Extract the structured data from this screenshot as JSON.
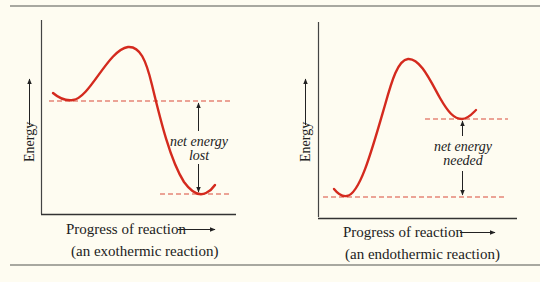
{
  "colors": {
    "curve": "#d42a1e",
    "dashed": "#d94a3a",
    "axis": "#333333",
    "rule": "#a8a8a0",
    "background": "#fefcf1"
  },
  "panels": [
    {
      "id": "exothermic",
      "y_axis_label": "Energy",
      "x_axis_label": "Progress of reaction",
      "caption": "(an exothermic reaction)",
      "annotation_line1": "net energy",
      "annotation_line2": "lost",
      "annotation_arrows": "double (up toward reactant level, down toward product level)"
    },
    {
      "id": "endothermic",
      "y_axis_label": "Energy",
      "x_axis_label": "Progress of reaction",
      "caption": "(an endothermic reaction)",
      "annotation_line1": "net energy",
      "annotation_line2": "needed",
      "annotation_arrows": "double (up toward product level, down toward reactant level)"
    }
  ],
  "icons": {
    "axis_arrow": "right-arrow-icon / up-arrow-icon"
  }
}
